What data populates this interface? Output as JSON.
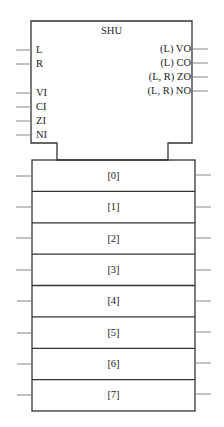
{
  "unit": {
    "title": "SHU",
    "inputs": [
      "L",
      "R",
      "VI",
      "CI",
      "ZI",
      "NI"
    ],
    "outputs": [
      "(L) VO",
      "(L) CO",
      "(L, R) ZO",
      "(L, R) NO"
    ]
  },
  "registers": {
    "labels": [
      "[0]",
      "[1]",
      "[2]",
      "[3]",
      "[4]",
      "[5]",
      "[6]",
      "[7]"
    ]
  },
  "colors": {
    "line": "#333333",
    "stub": "#777777",
    "background": "#ffffff"
  }
}
